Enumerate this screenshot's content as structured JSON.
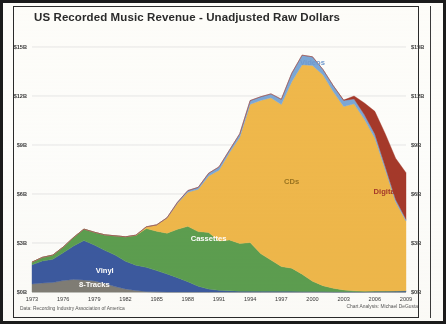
{
  "chart_data": {
    "type": "area",
    "stacked": true,
    "title": "US Recorded Music Revenue - Unadjusted Raw Dollars",
    "xlabel": "",
    "ylabel": "",
    "ylim": [
      0,
      15
    ],
    "xlim": [
      1973,
      2009
    ],
    "y_unit": "B",
    "y_prefix": "$",
    "grid": true,
    "legend_position": "inline-annotations",
    "y_ticks": [
      "$0B",
      "$3B",
      "$6B",
      "$9B",
      "$12B",
      "$15B"
    ],
    "y_tick_values": [
      0,
      3,
      6,
      9,
      12,
      15
    ],
    "y_axis_right_ticks": [
      "$0B",
      "$3B",
      "$6B",
      "$9B",
      "$12B",
      "$15B"
    ],
    "x_ticks": [
      "1973",
      "1976",
      "1979",
      "1982",
      "1985",
      "1988",
      "1991",
      "1994",
      "1997",
      "2000",
      "2003",
      "2006",
      "2009"
    ],
    "x_tick_values": [
      1973,
      1976,
      1979,
      1982,
      1985,
      1988,
      1991,
      1994,
      1997,
      2000,
      2003,
      2006,
      2009
    ],
    "x": [
      1973,
      1974,
      1975,
      1976,
      1977,
      1978,
      1979,
      1980,
      1981,
      1982,
      1983,
      1984,
      1985,
      1986,
      1987,
      1988,
      1989,
      1990,
      1991,
      1992,
      1993,
      1994,
      1995,
      1996,
      1997,
      1998,
      1999,
      2000,
      2001,
      2002,
      2003,
      2004,
      2005,
      2006,
      2007,
      2008,
      2009
    ],
    "series": [
      {
        "name": "8-Tracks",
        "color": "#807d76",
        "label_color": "#ffffff",
        "label_x": 1979,
        "label_y": 0.32,
        "values": [
          0.49,
          0.55,
          0.58,
          0.7,
          0.77,
          0.73,
          0.67,
          0.53,
          0.33,
          0.19,
          0.09,
          0.03,
          0.01,
          0.0,
          0.0,
          0.0,
          0.0,
          0.0,
          0.0,
          0.0,
          0.0,
          0.0,
          0.0,
          0.0,
          0.0,
          0.0,
          0.0,
          0.0,
          0.0,
          0.0,
          0.0,
          0.0,
          0.0,
          0.0,
          0.0,
          0.0,
          0.0
        ]
      },
      {
        "name": "Vinyl",
        "color": "#3c5aa0",
        "label_color": "#ffffff",
        "label_x": 1980,
        "label_y": 1.15,
        "values": [
          1.18,
          1.35,
          1.42,
          1.7,
          2.05,
          2.42,
          2.21,
          2.02,
          1.93,
          1.69,
          1.55,
          1.48,
          1.3,
          1.1,
          0.88,
          0.63,
          0.35,
          0.18,
          0.1,
          0.07,
          0.05,
          0.05,
          0.05,
          0.05,
          0.04,
          0.04,
          0.03,
          0.03,
          0.03,
          0.02,
          0.02,
          0.02,
          0.02,
          0.04,
          0.05,
          0.06,
          0.08
        ]
      },
      {
        "name": "Cassettes",
        "color": "#5d9e50",
        "label_color": "#ffffff",
        "label_x": 1990,
        "label_y": 3.1,
        "values": [
          0.16,
          0.22,
          0.26,
          0.35,
          0.52,
          0.7,
          0.78,
          0.95,
          1.18,
          1.5,
          1.82,
          2.38,
          2.41,
          2.5,
          2.96,
          3.39,
          3.35,
          3.47,
          3.02,
          3.12,
          2.92,
          2.98,
          2.3,
          1.91,
          1.52,
          1.42,
          1.06,
          0.63,
          0.36,
          0.21,
          0.11,
          0.05,
          0.03,
          0.02,
          0.01,
          0.0,
          0.0
        ]
      },
      {
        "name": "CDs",
        "color": "#efb84b",
        "label_color": "#9a7420",
        "label_x": 1998,
        "label_y": 6.6,
        "values": [
          0.0,
          0.0,
          0.0,
          0.0,
          0.0,
          0.0,
          0.0,
          0.0,
          0.0,
          0.0,
          0.02,
          0.1,
          0.39,
          0.93,
          1.59,
          2.09,
          2.59,
          3.45,
          4.34,
          5.33,
          6.51,
          8.46,
          9.38,
          9.93,
          9.92,
          11.42,
          12.82,
          13.21,
          12.91,
          12.04,
          11.23,
          11.45,
          10.52,
          9.37,
          7.45,
          5.47,
          4.27
        ]
      },
      {
        "name": "Videos",
        "color": "#7ba7d7",
        "label_color": "#6f9ad0",
        "label_x": 2000,
        "label_y": 13.9,
        "values": [
          0.0,
          0.0,
          0.0,
          0.0,
          0.0,
          0.0,
          0.0,
          0.0,
          0.0,
          0.0,
          0.0,
          0.0,
          0.0,
          0.02,
          0.06,
          0.1,
          0.12,
          0.17,
          0.2,
          0.16,
          0.21,
          0.23,
          0.22,
          0.24,
          0.32,
          0.51,
          0.59,
          0.53,
          0.33,
          0.36,
          0.37,
          0.3,
          0.28,
          0.25,
          0.18,
          0.14,
          0.1
        ]
      },
      {
        "name": "Digital",
        "color": "#a5392a",
        "label_color": "#a5392a",
        "label_x": 2007,
        "label_y": 6.0,
        "values": [
          0.0,
          0.0,
          0.0,
          0.0,
          0.0,
          0.0,
          0.0,
          0.0,
          0.0,
          0.0,
          0.0,
          0.0,
          0.0,
          0.0,
          0.0,
          0.0,
          0.0,
          0.0,
          0.0,
          0.0,
          0.0,
          0.0,
          0.0,
          0.0,
          0.0,
          0.0,
          0.0,
          0.0,
          0.0,
          0.0,
          0.02,
          0.18,
          0.72,
          1.38,
          2.0,
          2.52,
          2.85
        ]
      }
    ],
    "footnote_left": "Data: Recording Industry Association of America",
    "footnote_right": "Chart Analysis: Michael DeGusta"
  },
  "colors": {
    "eight_tracks": "#807d76",
    "vinyl": "#3c5aa0",
    "cassettes": "#5d9e50",
    "cds": "#efb84b",
    "videos": "#7ba7d7",
    "digital": "#a5392a",
    "gridline": "#d9d9d9",
    "title": "#2b2b2b",
    "frame": "#1b1b1b",
    "background": "#fdfdfb"
  }
}
